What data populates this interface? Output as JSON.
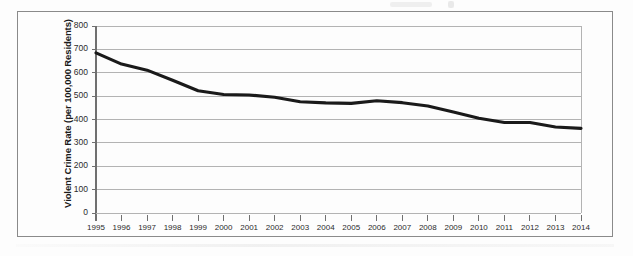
{
  "figure": {
    "frame_border_color": "#8a8a8a",
    "background_color": "#fdfdfd",
    "line_color": "#1a1a1a",
    "gridline_color": "#b3b3b3",
    "axis_color": "#6e6e6e"
  },
  "chart_data": {
    "type": "line",
    "title": "",
    "subtitle": "",
    "xlabel": "",
    "ylabel": "Violent Crime Rate (per 100,000 Residents)",
    "legend": [],
    "legend_position": "none",
    "grid": true,
    "ylim": [
      0,
      800
    ],
    "yticks": [
      0,
      100,
      200,
      300,
      400,
      500,
      600,
      700,
      800
    ],
    "ytick_labels": [
      "0",
      "100",
      "200",
      "300",
      "400",
      "500",
      "600",
      "700",
      "800"
    ],
    "categories": [
      "1995",
      "1996",
      "1997",
      "1998",
      "1999",
      "1900-placeholder",
      "2001",
      "2002",
      "2003",
      "2004",
      "2005",
      "2006",
      "2007",
      "2008",
      "2009",
      "2010",
      "2011",
      "2012",
      "2013",
      "2014"
    ],
    "x": [
      "1995",
      "1996",
      "1997",
      "1998",
      "1999",
      "2000",
      "2001",
      "2002",
      "2003",
      "2004",
      "2005",
      "2006",
      "2007",
      "2008",
      "2009",
      "2010",
      "2011",
      "2012",
      "2013",
      "2014"
    ],
    "xtick_labels": [
      "1995",
      "1996",
      "1997",
      "1998",
      "1999",
      "2000",
      "2001",
      "2002",
      "2003",
      "2004",
      "2005",
      "2006",
      "2007",
      "2008",
      "2009",
      "2010",
      "2011",
      "2012",
      "2013",
      "2014"
    ],
    "values": [
      685,
      637,
      611,
      568,
      523,
      507,
      505,
      495,
      476,
      471,
      469,
      480,
      472,
      458,
      432,
      405,
      387,
      387,
      368,
      362
    ],
    "series": [
      {
        "name": "Violent Crime Rate",
        "values": [
          685,
          637,
          611,
          568,
          523,
          507,
          505,
          495,
          476,
          471,
          469,
          480,
          472,
          458,
          432,
          405,
          387,
          387,
          368,
          362
        ]
      }
    ]
  }
}
